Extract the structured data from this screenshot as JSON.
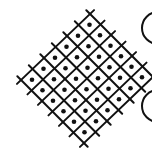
{
  "sketch": {
    "title": "Hand-drawn diamond lattice with dots",
    "stroke_color": "#111111",
    "background": "#ffffff",
    "grid": {
      "shape": "diamond",
      "rows": 6,
      "cols": 6,
      "cell_marker": "dot",
      "origin": [
        90,
        14
      ],
      "u": [
        10.5,
        10.5
      ],
      "v": [
        -11.5,
        11.0
      ]
    },
    "side_shapes": [
      {
        "type": "partial-circle",
        "label": "",
        "cx": 158,
        "cy": 28,
        "r": 16
      },
      {
        "type": "partial-circle",
        "label": "",
        "cx": 158,
        "cy": 106,
        "r": 16
      }
    ]
  }
}
